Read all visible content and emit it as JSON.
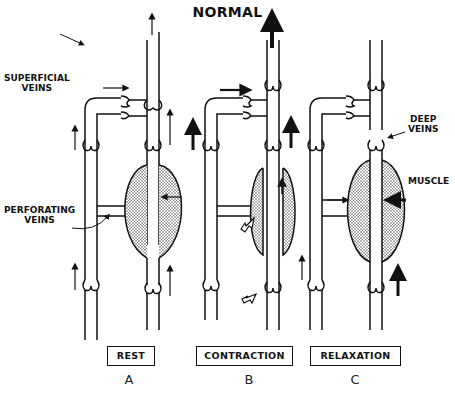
{
  "title": "NORMAL",
  "labels": {
    "superficial_veins": [
      "SUPERFICIAL",
      "VEINS"
    ],
    "perforating_veins": [
      "PERFORATING",
      "VEINS"
    ],
    "deep_veins": [
      "DEEP",
      "VEINS"
    ],
    "muscle": "MUSCLE"
  },
  "panels": [
    {
      "id": "A",
      "state": "REST",
      "letter": "A"
    },
    {
      "id": "B",
      "state": "CONTRACTION",
      "letter": "B"
    },
    {
      "id": "C",
      "state": "RELAXATION",
      "letter": "C"
    }
  ],
  "colors": {
    "ink": "#111111",
    "muscle_fill": "#d8d8d8",
    "background": "#ffffff"
  }
}
